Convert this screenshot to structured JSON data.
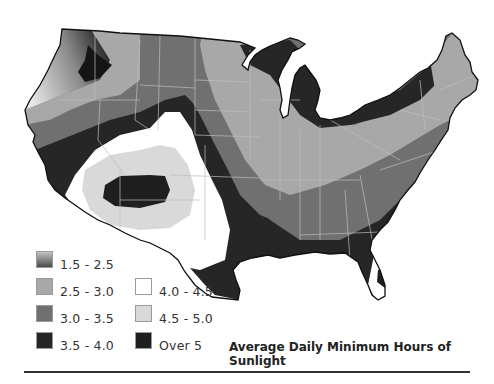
{
  "title": "Average Daily Minimum Hours of Sunlight",
  "legend": [
    {
      "label": "1.5 - 2.5",
      "color": "gradient",
      "from": "#c4c4c4",
      "to": "#4a4a4a"
    },
    {
      "label": "2.5 - 3.0",
      "color": "#a8a8a8"
    },
    {
      "label": "3.0 - 3.5",
      "color": "#707070"
    },
    {
      "label": "3.5 - 4.0",
      "color": "#262626"
    },
    {
      "label": "4.0 - 4.5",
      "color": "#ffffff"
    },
    {
      "label": "4.5 - 5.0",
      "color": "#d9d9d9"
    },
    {
      "label": "Over 5",
      "color": "#1f1f1f"
    }
  ],
  "map": {
    "region": "Contiguous United States",
    "outline_color": "#111111",
    "state_border_color": "#bdbdbd"
  }
}
